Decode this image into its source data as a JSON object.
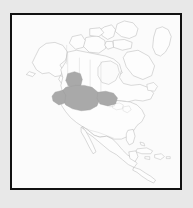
{
  "figure": {
    "kind": "thematic-distribution-map",
    "width": 193,
    "height": 208,
    "has_text_labels": false,
    "outer_background_color": "#e8e8e8",
    "panel_background_color": "#fbfbfb",
    "frame_color": "#111111",
    "frame_width_px": 2
  },
  "map": {
    "region_depicted": "North America",
    "projection_appearance": "conic",
    "land_fill_color": "#fdfdfd",
    "coastline_stroke_color": "#b9b9b9",
    "internal_border_stroke_color": "#cccccc",
    "landmasses": [
      "Alaska",
      "Canada",
      "Canadian Arctic Archipelago",
      "Greenland (partial, east edge)",
      "Contiguous United States",
      "Mexico",
      "Central America",
      "Caribbean islands",
      "Baja California",
      "Newfoundland",
      "Vancouver Island"
    ],
    "water_bodies_outlined": [
      "Hudson Bay",
      "Great Lakes",
      "Gulf of Mexico",
      "Gulf of California"
    ]
  },
  "highlight": {
    "label": "shaded-distribution-area",
    "fill_color": "#a9a9a9",
    "stroke_color": "#9a9a9a",
    "description": "Shaded range covering the United States Northern Great Plains and Upper Midwest, extending north across the international border into the Canadian Prairie provinces",
    "approximate_bounds_px": {
      "x_min": 62,
      "x_max": 105,
      "y_min": 84,
      "y_max": 108
    },
    "crosses_international_border": true
  }
}
